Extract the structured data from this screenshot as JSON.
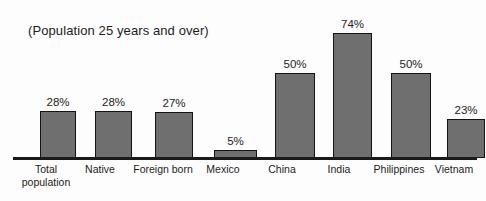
{
  "chart_data": {
    "type": "bar",
    "title": "(Population 25 years and over)",
    "xlabel": "",
    "ylabel": "",
    "ylim": [
      0,
      80
    ],
    "grid": false,
    "legend": null,
    "categories": [
      "Total population",
      "Native",
      "Foreign born",
      "Mexico",
      "China",
      "India",
      "Philippines",
      "Vietnam"
    ],
    "values": [
      28,
      28,
      27,
      5,
      50,
      74,
      50,
      23
    ],
    "value_labels": [
      "28%",
      "28%",
      "27%",
      "5%",
      "50%",
      "74%",
      "50%",
      "23%"
    ],
    "bar_color": "#6f6f6f",
    "bar_border_color": "#141414",
    "axis_color": "#1a1a1a",
    "background": "#fdfdfd"
  },
  "layout": {
    "px_per_percent": 1.69,
    "baseline_y": 157
  }
}
